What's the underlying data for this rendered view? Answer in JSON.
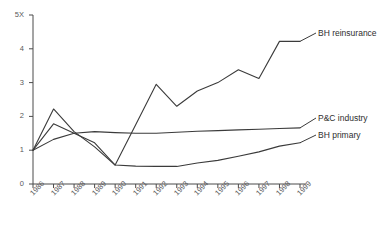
{
  "chart_data": {
    "type": "line",
    "title": "",
    "subtitle": "",
    "xlabel": "",
    "ylabel": "",
    "grid": false,
    "legend_position": "right-inline-labels",
    "categories": [
      "1986",
      "1987",
      "1988",
      "1989",
      "1990",
      "1991",
      "1992",
      "1993",
      "1994",
      "1995",
      "1996",
      "1997",
      "1998",
      "1999"
    ],
    "x": [
      1986,
      1987,
      1988,
      1989,
      1990,
      1991,
      1992,
      1993,
      1994,
      1995,
      1996,
      1997,
      1998,
      1999
    ],
    "ylim": [
      0,
      5
    ],
    "xlim": [
      1986,
      1999
    ],
    "yticks": [
      0,
      1,
      2,
      3,
      4,
      5
    ],
    "ytick_labels": [
      "0",
      "1",
      "2",
      "3",
      "4",
      "5X"
    ],
    "series": [
      {
        "name": "BH reinsurance",
        "values": [
          1.0,
          2.22,
          1.55,
          1.1,
          0.56,
          1.75,
          2.95,
          2.3,
          2.75,
          3.0,
          3.38,
          3.12,
          4.22,
          4.22
        ]
      },
      {
        "name": "P&C industry",
        "values": [
          1.0,
          1.32,
          1.5,
          1.55,
          1.52,
          1.5,
          1.5,
          1.53,
          1.56,
          1.58,
          1.6,
          1.62,
          1.64,
          1.66
        ]
      },
      {
        "name": "BH primary",
        "values": [
          1.0,
          1.78,
          1.5,
          1.22,
          0.56,
          0.53,
          0.52,
          0.52,
          0.62,
          0.7,
          0.82,
          0.95,
          1.12,
          1.22
        ]
      }
    ]
  },
  "annotations": {
    "bh_reinsurance_label": "BH reinsurance",
    "pc_industry_label": "P&C industry",
    "bh_primary_label": "BH primary"
  }
}
